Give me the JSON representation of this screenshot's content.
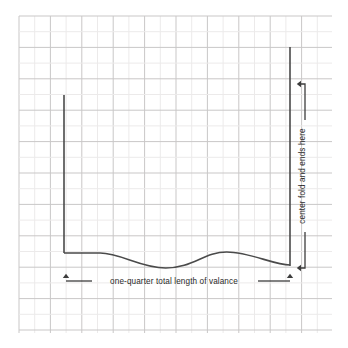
{
  "diagram": {
    "background_color": "#ffffff",
    "grid": {
      "minor_color": "#eceaea",
      "major_color": "#c9c7c7",
      "cell_size": 15.7,
      "major_every": 1,
      "left": 19,
      "top": 16,
      "right": 332,
      "bottom": 333,
      "columns": 20,
      "rows": 20
    },
    "line_color": "#4a4a4a",
    "dimension_color": "#3d3d3d",
    "labels": {
      "horizontal_dimension": "one-quarter total length of valance",
      "vertical_dimension": "center fold and ends here"
    },
    "geometry": {
      "left_edge_x": 64,
      "left_edge_top_y": 95,
      "left_edge_bottom_y": 253,
      "right_edge_x": 290,
      "right_edge_top_y": 47,
      "right_edge_bottom_y": 266,
      "hem_start_y": 253,
      "hem_end_y": 265,
      "wave_trough_y": 268,
      "wave_crest_y": 252
    },
    "dimension_lines": {
      "horizontal": {
        "y": 281,
        "x_start": 66,
        "x_end": 290,
        "arrow_direction_left": "up",
        "arrow_direction_right": "up"
      },
      "vertical": {
        "x": 305,
        "y_start": 84,
        "y_end": 268,
        "arrow_direction_top": "left",
        "arrow_direction_bottom": "left"
      }
    }
  }
}
